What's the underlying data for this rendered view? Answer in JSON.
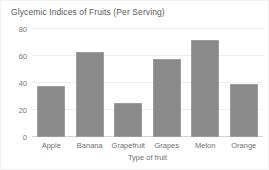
{
  "chart_data": {
    "type": "bar",
    "title": "Glycemic Indices of Fruits (Per Serving)",
    "xlabel": "Type of fruit",
    "ylabel": "",
    "categories": [
      "Apple",
      "Banana",
      "Grapefruit",
      "Grapes",
      "Melon",
      "Orange"
    ],
    "values": [
      38,
      63,
      25,
      58,
      72,
      39
    ],
    "yticks": [
      0,
      20,
      40,
      60,
      80
    ],
    "ylim": [
      0,
      80
    ],
    "grid": true,
    "legend": false,
    "colors": {
      "bar_fill": "#8a8a8a",
      "bar_border": "#9d9d9d",
      "gridline": "#ededed",
      "title_text": "#595959",
      "tick_text": "#777777",
      "background": "#ffffff"
    }
  }
}
